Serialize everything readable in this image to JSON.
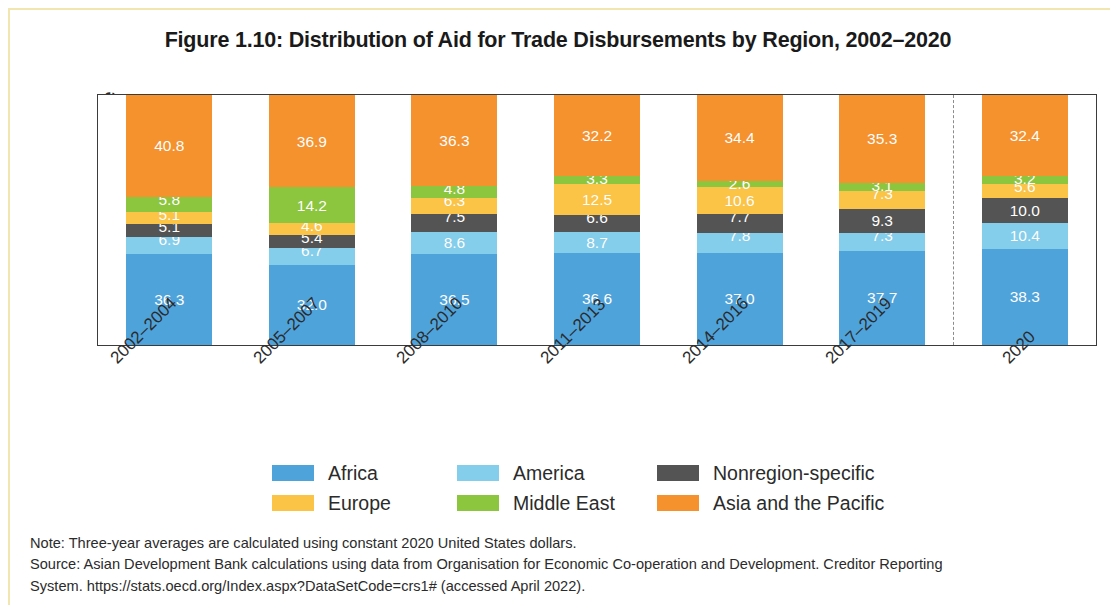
{
  "figure": {
    "title": "Figure 1.10: Distribution of Aid for Trade Disbursements by Region, 2002–2020"
  },
  "axes": {
    "y_title": "Percentage share",
    "y_ticks": [
      "100",
      "80",
      "60",
      "40",
      "20",
      "0"
    ]
  },
  "notes": {
    "line1": "Note: Three-year averages are calculated using constant 2020 United States dollars.",
    "line2": "Source: Asian Development Bank calculations using data from Organisation for Economic Co-operation and Development. Creditor Reporting",
    "line3": "System. https://stats.oecd.org/Index.aspx?DataSetCode=crs1# (accessed April 2022)."
  },
  "legend": {
    "entries": [
      {
        "label": "Africa",
        "color": "#4FA3DB"
      },
      {
        "label": "America",
        "color": "#84CEEC"
      },
      {
        "label": "Nonregion-specific",
        "color": "#545454"
      },
      {
        "label": "Europe",
        "color": "#FBC446"
      },
      {
        "label": "Middle East",
        "color": "#8CC63E"
      },
      {
        "label": "Asia and the Pacific",
        "color": "#F5922E"
      }
    ]
  },
  "chart_data": {
    "type": "bar",
    "stacked": true,
    "normalized": true,
    "title": "Figure 1.10: Distribution of Aid for Trade Disbursements by Region, 2002–2020",
    "xlabel": "",
    "ylabel": "Percentage share",
    "ylim": [
      0,
      100
    ],
    "ytick_values": [
      0,
      20,
      40,
      60,
      80,
      100
    ],
    "grid": false,
    "legend_position": "bottom",
    "divider_after_category_index": 5,
    "categories": [
      "2002–2004",
      "2005–2007",
      "2008–2010",
      "2011–2013",
      "2014–2016",
      "2017–2019",
      "2020"
    ],
    "series": [
      {
        "name": "Africa",
        "color": "#4FA3DB",
        "values": [
          36.3,
          32.0,
          36.5,
          36.6,
          37.0,
          37.7,
          38.3
        ]
      },
      {
        "name": "America",
        "color": "#84CEEC",
        "values": [
          6.9,
          6.7,
          8.6,
          8.7,
          7.8,
          7.3,
          10.4
        ]
      },
      {
        "name": "Nonregion-specific",
        "color": "#545454",
        "values": [
          5.1,
          5.4,
          7.5,
          6.6,
          7.7,
          9.3,
          10.0
        ]
      },
      {
        "name": "Europe",
        "color": "#FBC446",
        "values": [
          5.1,
          4.6,
          6.3,
          12.5,
          10.6,
          7.3,
          5.6
        ]
      },
      {
        "name": "Middle East",
        "color": "#8CC63E",
        "values": [
          5.8,
          14.2,
          4.8,
          3.3,
          2.6,
          3.1,
          3.2
        ]
      },
      {
        "name": "Asia and the Pacific",
        "color": "#F5922E",
        "values": [
          40.8,
          36.9,
          36.3,
          32.2,
          34.4,
          35.3,
          32.4
        ]
      }
    ],
    "value_labels": [
      [
        "36.3",
        "6.9",
        "5.1",
        "5.1",
        "5.8",
        "40.8"
      ],
      [
        "32.0",
        "6.7",
        "5.4",
        "4.6",
        "14.2",
        "36.9"
      ],
      [
        "36.5",
        "8.6",
        "7.5",
        "6.3",
        "4.8",
        "36.3"
      ],
      [
        "36.6",
        "8.7",
        "6.6",
        "12.5",
        "3.3",
        "32.2"
      ],
      [
        "37.0",
        "7.8",
        "7.7",
        "10.6",
        "2.6",
        "34.4"
      ],
      [
        "37.7",
        "7.3",
        "9.3",
        "7.3",
        "3.1",
        "35.3"
      ],
      [
        "38.3",
        "10.4",
        "10.0",
        "5.6",
        "3.2",
        "32.4"
      ]
    ]
  }
}
